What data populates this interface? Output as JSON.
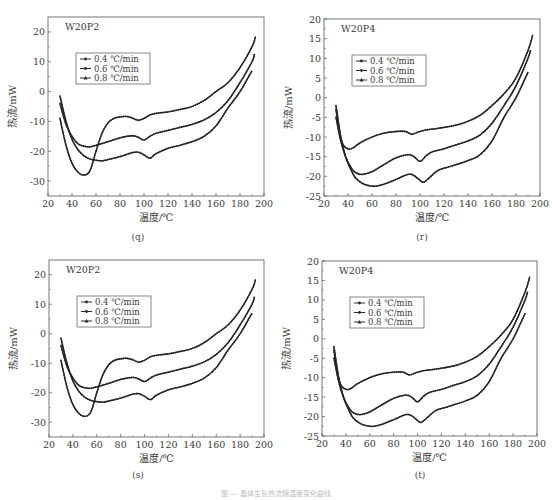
{
  "figure": {
    "caption": "图 — 晶体生长热流随温度变化曲线"
  },
  "chart_data": [
    {
      "id": "q",
      "type": "line",
      "sublabel": "(q)",
      "title": "W20P2",
      "xlabel": "温度/℃",
      "ylabel": "热流/mW",
      "xlim": [
        20,
        200
      ],
      "ylim": [
        -35,
        25
      ],
      "xticks": [
        20,
        40,
        60,
        80,
        100,
        120,
        140,
        160,
        180,
        200
      ],
      "yticks": [
        -30,
        -20,
        -10,
        0,
        10,
        20
      ],
      "legend": {
        "position": "upper-left-inset",
        "entries": [
          "0.4 ℃/min",
          "0.6 ℃/min",
          "0.8 ℃/min"
        ]
      },
      "grid": false,
      "series": [
        {
          "name": "0.4 ℃/min",
          "x": [
            30,
            35,
            40,
            45,
            50,
            55,
            60,
            65,
            70,
            75,
            80,
            85,
            90,
            95,
            100,
            105,
            110,
            120,
            130,
            140,
            150,
            160,
            170,
            180,
            190,
            193
          ],
          "y": [
            -9,
            -18,
            -24,
            -27,
            -28,
            -26.5,
            -20,
            -14,
            -10.5,
            -9,
            -8.5,
            -8.3,
            -8.8,
            -9.6,
            -9,
            -7.8,
            -7.3,
            -6.8,
            -6,
            -5,
            -3,
            0,
            3,
            8,
            15,
            18.5
          ]
        },
        {
          "name": "0.6 ℃/min",
          "x": [
            30,
            35,
            40,
            45,
            50,
            55,
            60,
            70,
            80,
            90,
            95,
            100,
            105,
            110,
            120,
            130,
            140,
            150,
            160,
            170,
            180,
            190,
            192
          ],
          "y": [
            -4,
            -11,
            -15,
            -17.5,
            -18.3,
            -18.5,
            -18,
            -16.8,
            -15.5,
            -14.8,
            -15.3,
            -16.2,
            -15,
            -14,
            -13,
            -12,
            -11,
            -9.5,
            -7,
            -3,
            3,
            10,
            12.5
          ]
        },
        {
          "name": "0.8 ℃/min",
          "x": [
            30,
            35,
            40,
            45,
            50,
            55,
            60,
            65,
            70,
            80,
            90,
            95,
            100,
            105,
            110,
            120,
            130,
            140,
            150,
            160,
            170,
            180,
            190
          ],
          "y": [
            -1.5,
            -10,
            -16,
            -19.5,
            -21.5,
            -22.6,
            -23,
            -23.2,
            -22.8,
            -21.8,
            -20.5,
            -20.3,
            -21.2,
            -22.3,
            -20.8,
            -19,
            -18,
            -16.8,
            -15,
            -11.5,
            -5.5,
            0,
            7
          ]
        }
      ]
    },
    {
      "id": "r",
      "type": "line",
      "sublabel": "(r)",
      "title": "W20P4",
      "xlabel": "温度/℃",
      "ylabel": "热流/mW",
      "xlim": [
        20,
        200
      ],
      "ylim": [
        -25,
        20
      ],
      "xticks": [
        20,
        40,
        60,
        80,
        100,
        120,
        140,
        160,
        180,
        200
      ],
      "yticks": [
        -25,
        -20,
        -15,
        -10,
        -5,
        0,
        5,
        10,
        15,
        20
      ],
      "legend": {
        "position": "upper-left-inset",
        "entries": [
          "0.4 ℃/min",
          "0.6 ℃/min",
          "0.8 ℃/min"
        ]
      },
      "grid": false,
      "series": [
        {
          "name": "0.4 ℃/min",
          "x": [
            30,
            33,
            36,
            40,
            44,
            50,
            60,
            70,
            80,
            88,
            93,
            98,
            105,
            115,
            130,
            140,
            150,
            160,
            170,
            180,
            190,
            194
          ],
          "y": [
            -3,
            -9,
            -12,
            -13,
            -12.8,
            -11.5,
            -10,
            -9,
            -8.6,
            -8.6,
            -9.3,
            -8.8,
            -8.2,
            -7.8,
            -7,
            -6,
            -4.5,
            -2,
            1,
            5,
            12,
            16
          ]
        },
        {
          "name": "0.6 ℃/min",
          "x": [
            30,
            34,
            38,
            42,
            46,
            52,
            60,
            70,
            80,
            90,
            95,
            100,
            105,
            110,
            120,
            130,
            140,
            150,
            160,
            170,
            180,
            190,
            192
          ],
          "y": [
            -5,
            -11,
            -15,
            -17.5,
            -19,
            -19.5,
            -18.8,
            -17,
            -15.3,
            -14.5,
            -15,
            -16.2,
            -14.8,
            -13.8,
            -13,
            -12,
            -11,
            -9.5,
            -6.5,
            -2,
            3,
            10,
            12
          ]
        },
        {
          "name": "0.8 ℃/min",
          "x": [
            30,
            34,
            38,
            42,
            46,
            52,
            58,
            63,
            70,
            80,
            90,
            95,
            100,
            103,
            108,
            115,
            125,
            140,
            150,
            160,
            170,
            180,
            190
          ],
          "y": [
            -2,
            -10,
            -15,
            -18,
            -20.3,
            -21.8,
            -22.4,
            -22.5,
            -22,
            -20.8,
            -19.5,
            -19.8,
            -21,
            -21.5,
            -20.3,
            -18.5,
            -17.5,
            -16,
            -14.5,
            -11,
            -5,
            0,
            6.5
          ]
        }
      ]
    },
    {
      "id": "s",
      "type": "line",
      "sublabel": "(s)",
      "title": "W20P2",
      "xlabel": "温度/℃",
      "ylabel": "热流/mW",
      "xlim": [
        20,
        200
      ],
      "ylim": [
        -35,
        25
      ],
      "xticks": [
        20,
        40,
        60,
        80,
        100,
        120,
        140,
        160,
        180,
        200
      ],
      "yticks": [
        -30,
        -20,
        -10,
        0,
        10,
        20
      ],
      "legend": {
        "position": "upper-left-inset",
        "entries": [
          "0.4 ℃/min",
          "0.6 ℃/min",
          "0.8 ℃/min"
        ]
      },
      "grid": false,
      "series": [
        {
          "name": "0.4 ℃/min",
          "x": [
            30,
            35,
            40,
            45,
            50,
            55,
            60,
            65,
            70,
            75,
            80,
            85,
            90,
            95,
            100,
            105,
            110,
            120,
            130,
            140,
            150,
            160,
            170,
            180,
            190,
            193
          ],
          "y": [
            -9,
            -18,
            -24,
            -27,
            -28,
            -26.5,
            -20,
            -14,
            -10.5,
            -9,
            -8.5,
            -8.3,
            -8.8,
            -9.6,
            -9,
            -7.8,
            -7.3,
            -6.8,
            -6,
            -5,
            -3,
            0,
            3,
            8,
            15,
            18.5
          ]
        },
        {
          "name": "0.6 ℃/min",
          "x": [
            30,
            35,
            40,
            45,
            50,
            55,
            60,
            70,
            80,
            90,
            95,
            100,
            105,
            110,
            120,
            130,
            140,
            150,
            160,
            170,
            180,
            190,
            192
          ],
          "y": [
            -4,
            -11,
            -15,
            -17.5,
            -18.3,
            -18.5,
            -18,
            -16.8,
            -15.5,
            -14.8,
            -15.3,
            -16.2,
            -15,
            -14,
            -13,
            -12,
            -11,
            -9.5,
            -7,
            -3,
            3,
            10,
            12.5
          ]
        },
        {
          "name": "0.8 ℃/min",
          "x": [
            30,
            35,
            40,
            45,
            50,
            55,
            60,
            65,
            70,
            80,
            90,
            95,
            100,
            105,
            110,
            120,
            130,
            140,
            150,
            160,
            170,
            180,
            190
          ],
          "y": [
            -1.5,
            -10,
            -16,
            -19.5,
            -21.5,
            -22.6,
            -23,
            -23.2,
            -22.8,
            -21.8,
            -20.5,
            -20.3,
            -21.2,
            -22.3,
            -20.8,
            -19,
            -18,
            -16.8,
            -15,
            -11.5,
            -5.5,
            0,
            7
          ]
        }
      ]
    },
    {
      "id": "t",
      "type": "line",
      "sublabel": "(t)",
      "title": "W20P4",
      "xlabel": "温度/℃",
      "ylabel": "热流/mW",
      "xlim": [
        20,
        200
      ],
      "ylim": [
        -25,
        20
      ],
      "xticks": [
        20,
        40,
        60,
        80,
        100,
        120,
        140,
        160,
        180,
        200
      ],
      "yticks": [
        -25,
        -20,
        -15,
        -10,
        -5,
        0,
        5,
        10,
        15,
        20
      ],
      "legend": {
        "position": "upper-left-inset",
        "entries": [
          "0.4 ℃/min",
          "0.6 ℃/min",
          "0.8 ℃/min"
        ]
      },
      "grid": false,
      "series": [
        {
          "name": "0.4 ℃/min",
          "x": [
            30,
            33,
            36,
            40,
            44,
            50,
            60,
            70,
            80,
            88,
            93,
            98,
            105,
            115,
            130,
            140,
            150,
            160,
            170,
            180,
            190,
            194
          ],
          "y": [
            -3,
            -9,
            -12,
            -13,
            -12.8,
            -11.5,
            -10,
            -9,
            -8.6,
            -8.6,
            -9.3,
            -8.8,
            -8.2,
            -7.8,
            -7,
            -6,
            -4.5,
            -2,
            1,
            5,
            12,
            16
          ]
        },
        {
          "name": "0.6 ℃/min",
          "x": [
            30,
            34,
            38,
            42,
            46,
            52,
            60,
            70,
            80,
            90,
            95,
            100,
            105,
            110,
            120,
            130,
            140,
            150,
            160,
            170,
            180,
            190,
            192
          ],
          "y": [
            -5,
            -11,
            -15,
            -17.5,
            -19,
            -19.5,
            -18.8,
            -17,
            -15.3,
            -14.5,
            -15,
            -16.2,
            -14.8,
            -13.8,
            -13,
            -12,
            -11,
            -9.5,
            -6.5,
            -2,
            3,
            10,
            12
          ]
        },
        {
          "name": "0.8 ℃/min",
          "x": [
            30,
            34,
            38,
            42,
            46,
            52,
            58,
            63,
            70,
            80,
            90,
            95,
            100,
            103,
            108,
            115,
            125,
            140,
            150,
            160,
            170,
            180,
            190
          ],
          "y": [
            -2,
            -10,
            -15,
            -18,
            -20.3,
            -21.8,
            -22.4,
            -22.5,
            -22,
            -20.8,
            -19.5,
            -19.8,
            -21,
            -21.5,
            -20.3,
            -18.5,
            -17.5,
            -16,
            -14.5,
            -11,
            -5,
            0,
            6.5
          ]
        }
      ]
    }
  ]
}
